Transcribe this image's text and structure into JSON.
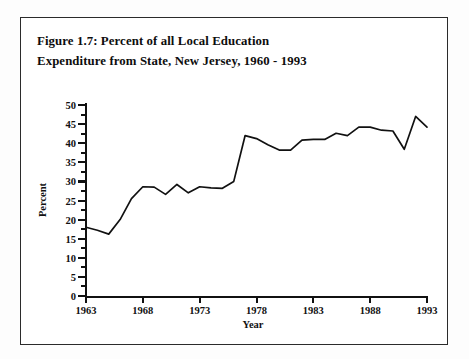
{
  "figure": {
    "title_line1": "Figure 1.7: Percent of all Local Education",
    "title_line2": "Expenditure from State, New Jersey, 1960 - 1993"
  },
  "chart_data": {
    "type": "line",
    "title": "Figure 1.7: Percent of all Local Education Expenditure from State, New Jersey, 1960 - 1993",
    "xlabel": "Year",
    "ylabel": "Percent",
    "xlim": [
      1963,
      1993
    ],
    "ylim": [
      0,
      50
    ],
    "xticks": [
      1963,
      1968,
      1973,
      1978,
      1983,
      1988,
      1993
    ],
    "xtick_labels": [
      "1963",
      "1968",
      "1973",
      "1978",
      "1983",
      "1988",
      "1993"
    ],
    "yticks": [
      0,
      5,
      10,
      15,
      20,
      25,
      30,
      35,
      40,
      45,
      50
    ],
    "ytick_labels": [
      "0",
      "5",
      "10",
      "15",
      "20",
      "25",
      "30",
      "35",
      "40",
      "45",
      "50"
    ],
    "grid": false,
    "legend": "none",
    "line_color": "#111111",
    "x": [
      1963,
      1964,
      1965,
      1966,
      1967,
      1968,
      1969,
      1970,
      1971,
      1972,
      1973,
      1974,
      1975,
      1976,
      1977,
      1978,
      1979,
      1980,
      1981,
      1982,
      1983,
      1984,
      1985,
      1986,
      1987,
      1988,
      1989,
      1990,
      1991,
      1992,
      1993
    ],
    "values": [
      18.0,
      17.2,
      16.2,
      20.0,
      25.5,
      28.6,
      28.5,
      26.6,
      29.2,
      27.0,
      28.6,
      28.3,
      28.2,
      30.0,
      42.0,
      41.2,
      39.6,
      38.2,
      38.2,
      40.8,
      41.0,
      41.0,
      42.6,
      42.0,
      44.2,
      44.2,
      43.4,
      43.2,
      38.4,
      47.0,
      44.2
    ]
  }
}
